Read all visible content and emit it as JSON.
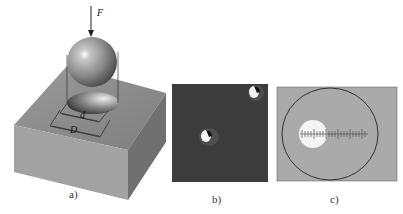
{
  "figure": {
    "panels": [
      {
        "id": "a",
        "caption": "a)",
        "description": "Steel ball indenter pressed into a block, leaving a spherical indentation",
        "labels": {
          "force": "F",
          "indent_diameter": "d",
          "ball_diameter": "D"
        }
      },
      {
        "id": "b",
        "caption": "b)",
        "description": "Micrograph of indentations on a surface"
      },
      {
        "id": "c",
        "caption": "c)",
        "description": "Measuring microscope view with scale reticle across indentation"
      }
    ],
    "colors": {
      "block_top": "#8e8e8e",
      "block_front": "#9a9a9a",
      "block_side": "#6e6e6e",
      "micrograph_bg": "#3a3a3a",
      "eyepiece_bg": "#aaaaaa",
      "indent_white": "#f4f4f4"
    }
  }
}
